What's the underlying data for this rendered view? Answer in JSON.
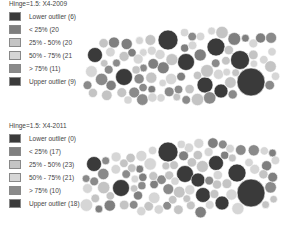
{
  "colors": {
    "lower_outlier": "#3a3a3a",
    "lt25": "#7f7f7f",
    "p25_50": "#c4c4c4",
    "p50_75": "#d6d6d6",
    "gt75": "#8a8a8a",
    "upper_outlier": "#3a3a3a",
    "stroke": "#ffffff"
  },
  "chart_data": [
    {
      "type": "bubble-cartogram",
      "title": "Hinge=1.5: X4-2009",
      "legend": [
        {
          "label": "Lower outlier (6)",
          "key": "lower_outlier",
          "count": 6
        },
        {
          "label": "< 25% (20)",
          "key": "lt25",
          "count": 20
        },
        {
          "label": "25% - 50% (20)",
          "key": "p25_50",
          "count": 20
        },
        {
          "label": "50% - 75% (21)",
          "key": "p50_75",
          "count": 21
        },
        {
          "label": "> 75% (11)",
          "key": "gt75",
          "count": 11
        },
        {
          "label": "Upper outlier (9)",
          "key": "upper_outlier",
          "count": 9
        }
      ]
    },
    {
      "type": "bubble-cartogram",
      "title": "Hinge=1.5: X4-2011",
      "legend": [
        {
          "label": "Lower outlier (0)",
          "key": "lower_outlier",
          "count": 0
        },
        {
          "label": "< 25% (17)",
          "key": "lt25",
          "count": 17
        },
        {
          "label": "25% - 50% (23)",
          "key": "p25_50",
          "count": 23
        },
        {
          "label": "50% - 75% (21)",
          "key": "p50_75",
          "count": 21
        },
        {
          "label": "> 75% (10)",
          "key": "gt75",
          "count": 10
        },
        {
          "label": "Upper outlier (18)",
          "key": "upper_outlier",
          "count": 18
        }
      ]
    }
  ],
  "panels": [
    {
      "title": "Hinge=1.5: X4-2009",
      "legend": [
        {
          "label": "Lower outlier (6)",
          "key": "lower_outlier"
        },
        {
          "label": "< 25% (20",
          "key": "lt25"
        },
        {
          "label": "25% - 50% (20",
          "key": "p25_50"
        },
        {
          "label": "50% - 75% (21",
          "key": "p50_75"
        },
        {
          "label": "> 75% (11)",
          "key": "gt75"
        },
        {
          "label": "Upper outlier (9)",
          "key": "upper_outlier"
        }
      ],
      "big": [
        [
          168,
          40,
          10,
          "upper_outlier"
        ],
        [
          95,
          55,
          7.5,
          "upper_outlier"
        ],
        [
          124,
          77,
          8.5,
          "upper_outlier"
        ],
        [
          186,
          62,
          8.5,
          "upper_outlier"
        ],
        [
          216,
          47,
          9,
          "upper_outlier"
        ],
        [
          240,
          60,
          9.5,
          "upper_outlier"
        ],
        [
          205,
          85,
          8,
          "upper_outlier"
        ],
        [
          221,
          91,
          7,
          "upper_outlier"
        ],
        [
          251,
          82,
          14,
          "upper_outlier"
        ]
      ]
    },
    {
      "title": "Hinge=1.5: X4-2011",
      "legend": [
        {
          "label": "Lower outlier (0)",
          "key": "lower_outlier"
        },
        {
          "label": "< 25% (17)",
          "key": "lt25"
        },
        {
          "label": "25% - 50% (23)",
          "key": "p25_50"
        },
        {
          "label": "50% - 75% (21)",
          "key": "p50_75"
        },
        {
          "label": "> 75% (10)",
          "key": "gt75"
        },
        {
          "label": "Upper outlier (18)",
          "key": "upper_outlier"
        }
      ],
      "big": [
        [
          168,
          39,
          10,
          "upper_outlier"
        ],
        [
          94,
          51,
          7.5,
          "upper_outlier"
        ],
        [
          121,
          75,
          8.5,
          "upper_outlier"
        ],
        [
          185,
          61,
          8.5,
          "upper_outlier"
        ],
        [
          198,
          67,
          7,
          "upper_outlier"
        ],
        [
          216,
          50,
          7.5,
          "upper_outlier"
        ],
        [
          237,
          60,
          9,
          "upper_outlier"
        ],
        [
          203,
          82,
          7.5,
          "upper_outlier"
        ],
        [
          222,
          90,
          7,
          "upper_outlier"
        ],
        [
          251,
          80,
          14,
          "upper_outlier"
        ]
      ]
    }
  ]
}
